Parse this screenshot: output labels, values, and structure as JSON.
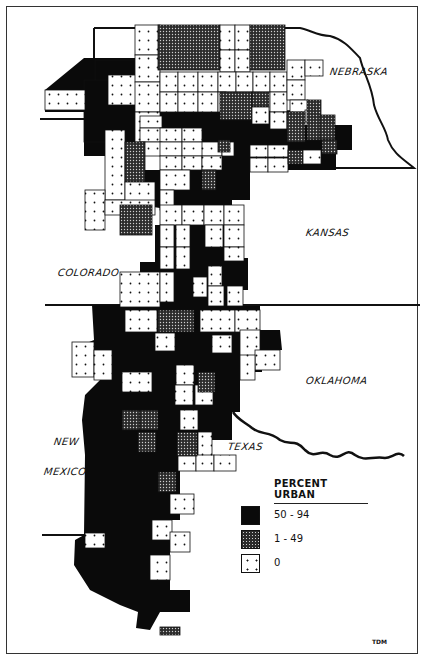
{
  "map": {
    "title": "Percent Urban",
    "states": [
      {
        "name": "NEBRASKA",
        "x": 330,
        "y": 66
      },
      {
        "name": "KANSAS",
        "x": 306,
        "y": 227
      },
      {
        "name": "COLORADO",
        "x": 58,
        "y": 267
      },
      {
        "name": "OKLAHOMA",
        "x": 306,
        "y": 375
      },
      {
        "name": "TEXAS",
        "x": 228,
        "y": 441
      },
      {
        "name": "NEW",
        "x": 54,
        "y": 436
      },
      {
        "name": "MEXICO",
        "x": 44,
        "y": 466
      }
    ],
    "colors": {
      "urban": "#0a0a0a",
      "partial": "#2b2b2b",
      "zero": "#ffffff",
      "ink": "#111111"
    }
  },
  "legend": {
    "title": "PERCENT URBAN",
    "items": [
      {
        "label": "50 - 94",
        "class": "high"
      },
      {
        "label": "1 - 49",
        "class": "medium"
      },
      {
        "label": "0",
        "class": "zero"
      }
    ]
  },
  "credit": "TDM",
  "cells": [
    [
      "b",
      95,
      60,
      40,
      22
    ],
    [
      "b",
      84,
      80,
      51,
      62
    ],
    [
      "z",
      45,
      90,
      40,
      20
    ],
    [
      "z",
      108,
      75,
      30,
      30
    ],
    [
      "z",
      135,
      25,
      25,
      30
    ],
    [
      "z",
      135,
      55,
      25,
      27
    ],
    [
      "z",
      135,
      82,
      25,
      30
    ],
    [
      "z",
      135,
      112,
      25,
      30
    ],
    [
      "p",
      158,
      25,
      62,
      45
    ],
    [
      "z",
      220,
      25,
      15,
      25
    ],
    [
      "z",
      235,
      25,
      15,
      25
    ],
    [
      "z",
      220,
      50,
      15,
      22
    ],
    [
      "z",
      235,
      50,
      15,
      22
    ],
    [
      "p",
      250,
      25,
      35,
      45
    ],
    [
      "z",
      160,
      72,
      18,
      20
    ],
    [
      "z",
      178,
      72,
      20,
      20
    ],
    [
      "z",
      198,
      72,
      20,
      20
    ],
    [
      "z",
      218,
      72,
      18,
      20
    ],
    [
      "z",
      236,
      72,
      17,
      20
    ],
    [
      "z",
      253,
      72,
      17,
      20
    ],
    [
      "z",
      270,
      72,
      17,
      20
    ],
    [
      "z",
      160,
      92,
      18,
      20
    ],
    [
      "z",
      178,
      92,
      20,
      20
    ],
    [
      "z",
      198,
      92,
      20,
      20
    ],
    [
      "z",
      218,
      92,
      8,
      20
    ],
    [
      "p",
      220,
      92,
      32,
      28
    ],
    [
      "p",
      252,
      92,
      17,
      15
    ],
    [
      "z",
      270,
      92,
      17,
      20
    ],
    [
      "z",
      252,
      107,
      17,
      17
    ],
    [
      "z",
      270,
      112,
      17,
      17
    ],
    [
      "z",
      287,
      60,
      18,
      20
    ],
    [
      "z",
      305,
      60,
      18,
      16
    ],
    [
      "z",
      287,
      80,
      18,
      20
    ],
    [
      "z",
      290,
      100,
      18,
      12
    ],
    [
      "z",
      305,
      110,
      14,
      12
    ],
    [
      "p",
      307,
      100,
      14,
      40
    ],
    [
      "p",
      287,
      112,
      18,
      30
    ],
    [
      "p",
      320,
      115,
      15,
      25
    ],
    [
      "p",
      322,
      140,
      15,
      14
    ],
    [
      "z",
      140,
      116,
      22,
      12
    ],
    [
      "z",
      140,
      128,
      22,
      14
    ],
    [
      "z",
      160,
      128,
      22,
      14
    ],
    [
      "z",
      182,
      128,
      20,
      14
    ],
    [
      "z",
      140,
      142,
      22,
      14
    ],
    [
      "z",
      160,
      142,
      22,
      14
    ],
    [
      "z",
      182,
      142,
      22,
      14
    ],
    [
      "z",
      202,
      142,
      20,
      14
    ],
    [
      "z",
      222,
      142,
      12,
      14
    ],
    [
      "p",
      218,
      140,
      12,
      12
    ],
    [
      "z",
      250,
      145,
      18,
      12
    ],
    [
      "z",
      268,
      145,
      20,
      12
    ],
    [
      "z",
      250,
      158,
      18,
      14
    ],
    [
      "z",
      268,
      158,
      20,
      14
    ],
    [
      "p",
      288,
      150,
      15,
      14
    ],
    [
      "z",
      303,
      150,
      18,
      14
    ],
    [
      "z",
      105,
      130,
      20,
      70
    ],
    [
      "z",
      85,
      190,
      20,
      40
    ],
    [
      "p",
      125,
      142,
      20,
      40
    ],
    [
      "z",
      125,
      182,
      30,
      20
    ],
    [
      "z",
      105,
      200,
      50,
      15
    ],
    [
      "z",
      160,
      156,
      22,
      14
    ],
    [
      "z",
      182,
      156,
      20,
      14
    ],
    [
      "z",
      202,
      156,
      20,
      14
    ],
    [
      "z",
      160,
      170,
      30,
      20
    ],
    [
      "z",
      160,
      190,
      14,
      20
    ],
    [
      "p",
      202,
      170,
      14,
      20
    ],
    [
      "p",
      120,
      205,
      32,
      30
    ],
    [
      "z",
      160,
      205,
      22,
      20
    ],
    [
      "z",
      182,
      205,
      22,
      20
    ],
    [
      "z",
      204,
      205,
      20,
      20
    ],
    [
      "z",
      224,
      205,
      20,
      20
    ],
    [
      "z",
      160,
      225,
      14,
      22
    ],
    [
      "z",
      176,
      225,
      14,
      22
    ],
    [
      "z",
      205,
      225,
      18,
      22
    ],
    [
      "z",
      224,
      225,
      20,
      22
    ],
    [
      "z",
      160,
      247,
      14,
      22
    ],
    [
      "z",
      176,
      247,
      14,
      22
    ],
    [
      "z",
      224,
      247,
      20,
      14
    ],
    [
      "z",
      120,
      272,
      40,
      35
    ],
    [
      "z",
      160,
      272,
      14,
      30
    ],
    [
      "z",
      193,
      277,
      14,
      20
    ],
    [
      "z",
      208,
      266,
      14,
      20
    ],
    [
      "z",
      208,
      286,
      16,
      20
    ],
    [
      "z",
      227,
      286,
      16,
      20
    ],
    [
      "z",
      125,
      310,
      32,
      22
    ],
    [
      "z",
      200,
      310,
      35,
      22
    ],
    [
      "z",
      235,
      310,
      25,
      22
    ],
    [
      "p",
      158,
      310,
      36,
      22
    ],
    [
      "z",
      155,
      333,
      20,
      18
    ],
    [
      "z",
      212,
      335,
      20,
      18
    ],
    [
      "z",
      240,
      330,
      20,
      30
    ],
    [
      "z",
      255,
      350,
      25,
      20
    ],
    [
      "z",
      240,
      355,
      15,
      25
    ],
    [
      "z",
      72,
      342,
      22,
      35
    ],
    [
      "z",
      94,
      350,
      18,
      30
    ],
    [
      "z",
      122,
      372,
      30,
      20
    ],
    [
      "z",
      176,
      365,
      18,
      20
    ],
    [
      "z",
      175,
      385,
      18,
      20
    ],
    [
      "z",
      195,
      385,
      18,
      20
    ],
    [
      "z",
      180,
      410,
      18,
      20
    ],
    [
      "z",
      198,
      432,
      14,
      24
    ],
    [
      "z",
      178,
      455,
      18,
      16
    ],
    [
      "z",
      196,
      455,
      18,
      16
    ],
    [
      "z",
      214,
      455,
      22,
      16
    ],
    [
      "p",
      198,
      372,
      17,
      20
    ],
    [
      "p",
      122,
      410,
      18,
      20
    ],
    [
      "p",
      140,
      410,
      18,
      20
    ],
    [
      "p",
      138,
      432,
      18,
      20
    ],
    [
      "p",
      177,
      432,
      20,
      24
    ],
    [
      "p",
      158,
      472,
      18,
      20
    ],
    [
      "z",
      170,
      494,
      24,
      20
    ],
    [
      "z",
      152,
      520,
      20,
      20
    ],
    [
      "z",
      170,
      532,
      20,
      20
    ],
    [
      "z",
      150,
      555,
      20,
      25
    ],
    [
      "z",
      85,
      533,
      20,
      15
    ],
    [
      "p",
      160,
      627,
      20,
      8
    ]
  ]
}
